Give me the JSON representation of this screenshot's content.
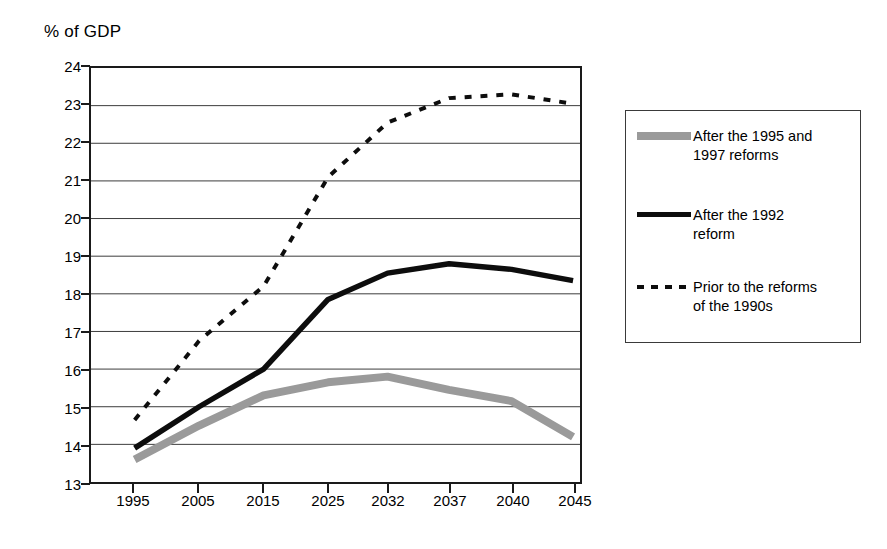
{
  "chart_data": {
    "type": "line",
    "title": "",
    "ylabel": "% of GDP",
    "xlabel": "",
    "ylim": [
      13,
      24
    ],
    "ytick_step": 1,
    "grid": true,
    "legend_position": "right",
    "categories": [
      "1995",
      "2005",
      "2015",
      "2025",
      "2032",
      "2037",
      "2040",
      "2045"
    ],
    "yticks": [
      "24",
      "23",
      "22",
      "21",
      "20",
      "19",
      "18",
      "17",
      "16",
      "15",
      "14",
      "13"
    ],
    "series": [
      {
        "name": "After the 1995 and 1997 reforms",
        "style": "thick-gray",
        "color": "#9a9a9a",
        "values": [
          13.6,
          14.5,
          15.3,
          15.65,
          15.8,
          15.45,
          15.15,
          14.2
        ]
      },
      {
        "name": "After the 1992 reform",
        "style": "thick-black",
        "color": "#0d0d0d",
        "values": [
          13.9,
          15.0,
          16.0,
          17.85,
          18.55,
          18.8,
          18.65,
          18.35
        ]
      },
      {
        "name": "Prior to the reforms of the 1990s",
        "style": "dotted-black",
        "color": "#0d0d0d",
        "values": [
          14.65,
          16.75,
          18.2,
          21.1,
          22.55,
          23.2,
          23.3,
          23.05
        ]
      }
    ]
  },
  "legend": {
    "entries": [
      {
        "label_line1": "After the 1995 and",
        "label_line2": "1997 reforms",
        "swatch": "thick-gray-line-swatch"
      },
      {
        "label_line1": "After the 1992",
        "label_line2": "reform",
        "swatch": "thick-black-line-swatch"
      },
      {
        "label_line1": "Prior to the reforms",
        "label_line2": "of the 1990s",
        "swatch": "dotted-black-line-swatch"
      }
    ]
  }
}
